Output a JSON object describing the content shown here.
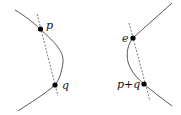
{
  "diagram": {
    "left_panel": {
      "points": [
        {
          "label": "p"
        },
        {
          "label": "q"
        }
      ]
    },
    "right_panel": {
      "points": [
        {
          "label": "e"
        },
        {
          "label": "p+q"
        }
      ]
    },
    "colors": {
      "curve": "#444444",
      "dashed_line": "#555555",
      "point": "#000000"
    }
  }
}
